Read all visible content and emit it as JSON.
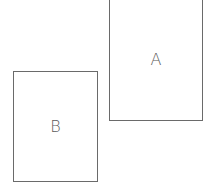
{
  "diagram": {
    "shapes": [
      {
        "id": "A",
        "label": "A",
        "type": "rectangle"
      },
      {
        "id": "B",
        "label": "B",
        "type": "rectangle"
      }
    ],
    "colors": {
      "stroke": "#6a6a6a",
      "text": "#5a5a5a",
      "background": "#ffffff"
    }
  }
}
